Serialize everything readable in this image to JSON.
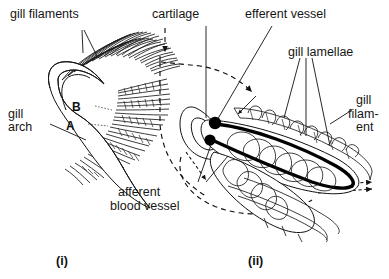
{
  "figure": {
    "background_color": "#ffffff",
    "ink_color": "#121212",
    "panels": [
      {
        "id": "i",
        "caption": "(i)",
        "description": "gill arch bearing rows of gill filaments",
        "labels": [
          {
            "name": "gill-filaments",
            "text": "gill filaments",
            "lines": [
              "gill filaments"
            ]
          },
          {
            "name": "gill-arch",
            "text": "gill arch",
            "lines": [
              "gill",
              "arch"
            ]
          }
        ],
        "point_markers": [
          {
            "name": "point-a",
            "text": "A"
          },
          {
            "name": "point-b",
            "text": "B"
          }
        ]
      },
      {
        "id": "ii",
        "caption": "(ii)",
        "description": "enlarged single gill filament with lamellae and blood vessels",
        "labels": [
          {
            "name": "cartilage",
            "text": "cartilage",
            "lines": [
              "cartilage"
            ]
          },
          {
            "name": "efferent-vessel",
            "text": "efferent vessel",
            "lines": [
              "efferent  vessel"
            ]
          },
          {
            "name": "gill-lamellae",
            "text": "gill lamellae",
            "lines": [
              "gill  lamellae"
            ]
          },
          {
            "name": "gill-filament",
            "text": "gill filament",
            "lines": [
              "gill",
              "filam-",
              "ent"
            ]
          },
          {
            "name": "afferent-blood-vessel",
            "text": "afferent blood vessel",
            "lines": [
              "afferent",
              "blood  vessel"
            ]
          }
        ],
        "flow_arrows": [
          {
            "name": "water-inflow-arrow",
            "style": "dashed",
            "direction": "down-right"
          },
          {
            "name": "water-outflow-arrow",
            "style": "dashed-double",
            "direction": "right"
          }
        ]
      }
    ]
  }
}
